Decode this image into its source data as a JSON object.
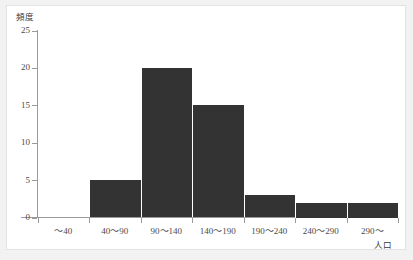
{
  "chart_data": {
    "type": "bar",
    "title": "",
    "subtitle": "",
    "xlabel": "人口",
    "ylabel": "頻度",
    "categories": [
      "～40",
      "40～90",
      "90～140",
      "140～190",
      "190～240",
      "240～290",
      "290～"
    ],
    "values": [
      0,
      5,
      20,
      15,
      3,
      2,
      2
    ],
    "ylim": [
      0,
      25
    ],
    "y_ticks": [
      0,
      5,
      10,
      15,
      20,
      25
    ],
    "y_tick_labels": [
      "0",
      "5",
      "10",
      "15",
      "20",
      "25"
    ],
    "grid": false,
    "legend": false,
    "legend_position": "none",
    "bar_color": "#333333",
    "axis_color": "#9a9a9a",
    "background_color": "#ffffff",
    "page_background_color": "#f2f2f2",
    "annotations": []
  },
  "axes": {
    "y_title": "頻度",
    "x_title": "人口"
  }
}
